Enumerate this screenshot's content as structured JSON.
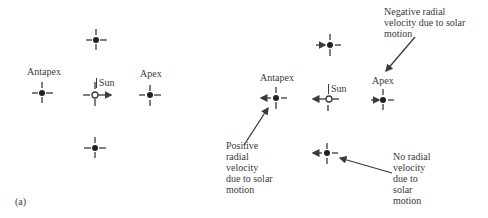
{
  "panel_a": {
    "label": "(a)",
    "antapex_label": "Antapex",
    "apex_label": "Apex",
    "sun_label": "Sun"
  },
  "panel_b": {
    "antapex_label": "Antapex",
    "apex_label": "Apex",
    "sun_label": "Sun",
    "annotations": {
      "negative": [
        "Negative radial",
        "velocity due to solar",
        "motion"
      ],
      "positive": [
        "Positive",
        "radial",
        "velocity",
        "due to solar",
        "motion"
      ],
      "none": [
        "No radial",
        "velocity",
        "due to",
        "solar",
        "motion"
      ]
    }
  },
  "colors": {
    "ink": "#3a3a3a",
    "star": "#222222",
    "background": "#ffffff"
  }
}
